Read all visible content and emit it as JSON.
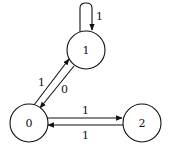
{
  "diagram": {
    "type": "state-transition-graph",
    "nodes": [
      {
        "id": "0",
        "label": "0",
        "cx": 29,
        "cy": 123,
        "r": 19
      },
      {
        "id": "1",
        "label": "1",
        "cx": 86,
        "cy": 50,
        "r": 19
      },
      {
        "id": "2",
        "label": "2",
        "cx": 142,
        "cy": 123,
        "r": 19
      }
    ],
    "edges": [
      {
        "from": "1",
        "to": "1",
        "label": "1",
        "kind": "self-loop"
      },
      {
        "from": "0",
        "to": "1",
        "label": "1"
      },
      {
        "from": "1",
        "to": "0",
        "label": "0"
      },
      {
        "from": "0",
        "to": "2",
        "label": "1"
      },
      {
        "from": "2",
        "to": "0",
        "label": "1"
      }
    ],
    "colors": {
      "stroke": "#111111",
      "background": "#ffffff"
    }
  }
}
